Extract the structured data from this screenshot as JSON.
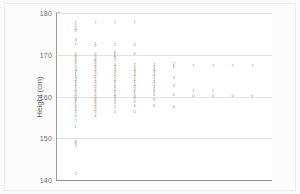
{
  "chart_data": {
    "type": "scatter",
    "title": "",
    "xlabel": "",
    "ylabel": "Height (cm)",
    "ylim": [
      140,
      180
    ],
    "yticks": [
      140,
      150,
      160,
      170,
      180
    ],
    "ytick_labels": [
      "140",
      "150",
      "160",
      "170",
      "180"
    ],
    "xlim": [
      0,
      11
    ],
    "xticks": [],
    "xtick_labels": [],
    "grid": "horizontal",
    "legend": "none",
    "marker_style": "digit-glyph",
    "note": "Each plotted point is drawn as a small digit character stacked vertically at its column position.",
    "colors": {
      "panel_background": "#ffffff",
      "figure_background": "#fcfcfc",
      "gridline": "#e2e2e6",
      "axis": "#8f8f8f",
      "marker": "#8d8d93",
      "tick_label": "#6b6b6b",
      "axis_title": "#5a5a5a"
    },
    "series": [
      {
        "name": "column-1",
        "x": 1,
        "points": [
          {
            "y": 177.6,
            "label": "7"
          },
          {
            "y": 176.8,
            "label": "1"
          },
          {
            "y": 176.2,
            "label": "0"
          },
          {
            "y": 175.6,
            "label": "5"
          },
          {
            "y": 173.6,
            "label": "3"
          },
          {
            "y": 172.6,
            "label": "1"
          },
          {
            "y": 170.2,
            "label": "0"
          },
          {
            "y": 169.4,
            "label": "8"
          },
          {
            "y": 168.8,
            "label": "9"
          },
          {
            "y": 168.2,
            "label": "6"
          },
          {
            "y": 167.6,
            "label": "7"
          },
          {
            "y": 167.0,
            "label": "5"
          },
          {
            "y": 166.4,
            "label": "4"
          },
          {
            "y": 165.8,
            "label": "3"
          },
          {
            "y": 165.2,
            "label": "1"
          },
          {
            "y": 164.6,
            "label": "4"
          },
          {
            "y": 164.0,
            "label": "2"
          },
          {
            "y": 163.4,
            "label": "6"
          },
          {
            "y": 162.8,
            "label": "4"
          },
          {
            "y": 162.2,
            "label": "1"
          },
          {
            "y": 161.6,
            "label": "4"
          },
          {
            "y": 161.0,
            "label": "0"
          },
          {
            "y": 160.4,
            "label": "2"
          },
          {
            "y": 159.8,
            "label": "0"
          },
          {
            "y": 159.2,
            "label": "8"
          },
          {
            "y": 158.6,
            "label": "6"
          },
          {
            "y": 158.0,
            "label": "5"
          },
          {
            "y": 157.4,
            "label": "4"
          },
          {
            "y": 156.8,
            "label": "4"
          },
          {
            "y": 156.2,
            "label": "1"
          },
          {
            "y": 155.4,
            "label": "4"
          },
          {
            "y": 154.2,
            "label": "2"
          },
          {
            "y": 152.6,
            "label": "1"
          },
          {
            "y": 149.2,
            "label": "8"
          },
          {
            "y": 148.6,
            "label": "6"
          },
          {
            "y": 148.0,
            "label": "7"
          },
          {
            "y": 141.4,
            "label": "2"
          }
        ]
      },
      {
        "name": "column-2",
        "x": 2,
        "points": [
          {
            "y": 177.6,
            "label": "7"
          },
          {
            "y": 172.6,
            "label": "1"
          },
          {
            "y": 172.0,
            "label": "0"
          },
          {
            "y": 170.2,
            "label": "0"
          },
          {
            "y": 169.4,
            "label": "9"
          },
          {
            "y": 168.8,
            "label": "8"
          },
          {
            "y": 168.2,
            "label": "6"
          },
          {
            "y": 167.6,
            "label": "5"
          },
          {
            "y": 167.0,
            "label": "4"
          },
          {
            "y": 166.4,
            "label": "4"
          },
          {
            "y": 165.8,
            "label": "3"
          },
          {
            "y": 165.2,
            "label": "2"
          },
          {
            "y": 164.6,
            "label": "4"
          },
          {
            "y": 164.0,
            "label": "1"
          },
          {
            "y": 163.4,
            "label": "4"
          },
          {
            "y": 162.8,
            "label": "2"
          },
          {
            "y": 162.2,
            "label": "0"
          },
          {
            "y": 161.6,
            "label": "4"
          },
          {
            "y": 161.0,
            "label": "1"
          },
          {
            "y": 160.4,
            "label": "0"
          },
          {
            "y": 159.8,
            "label": "0"
          },
          {
            "y": 159.2,
            "label": "8"
          },
          {
            "y": 158.6,
            "label": "6"
          },
          {
            "y": 158.0,
            "label": "5"
          },
          {
            "y": 157.4,
            "label": "4"
          },
          {
            "y": 156.8,
            "label": "2"
          },
          {
            "y": 156.2,
            "label": "0"
          },
          {
            "y": 155.4,
            "label": "4"
          }
        ]
      },
      {
        "name": "column-3",
        "x": 3,
        "points": [
          {
            "y": 177.6,
            "label": "7"
          },
          {
            "y": 172.4,
            "label": "2"
          },
          {
            "y": 170.4,
            "label": "8"
          },
          {
            "y": 169.8,
            "label": "6"
          },
          {
            "y": 169.2,
            "label": "5"
          },
          {
            "y": 168.4,
            "label": "7"
          },
          {
            "y": 167.6,
            "label": "4"
          },
          {
            "y": 167.0,
            "label": "5"
          },
          {
            "y": 166.4,
            "label": "3"
          },
          {
            "y": 165.8,
            "label": "4"
          },
          {
            "y": 165.2,
            "label": "1"
          },
          {
            "y": 164.6,
            "label": "2"
          },
          {
            "y": 164.0,
            "label": "4"
          },
          {
            "y": 163.4,
            "label": "6"
          },
          {
            "y": 162.8,
            "label": "1"
          },
          {
            "y": 162.2,
            "label": "4"
          },
          {
            "y": 161.6,
            "label": "0"
          },
          {
            "y": 161.0,
            "label": "2"
          },
          {
            "y": 160.4,
            "label": "0"
          },
          {
            "y": 159.8,
            "label": "8"
          },
          {
            "y": 159.2,
            "label": "6"
          },
          {
            "y": 158.4,
            "label": "4"
          },
          {
            "y": 157.6,
            "label": "2"
          },
          {
            "y": 156.4,
            "label": "0"
          }
        ]
      },
      {
        "name": "column-4",
        "x": 4,
        "points": [
          {
            "y": 177.6,
            "label": "7"
          },
          {
            "y": 172.4,
            "label": "2"
          },
          {
            "y": 170.2,
            "label": "0"
          },
          {
            "y": 167.6,
            "label": "7"
          },
          {
            "y": 167.0,
            "label": "5"
          },
          {
            "y": 166.4,
            "label": "4"
          },
          {
            "y": 165.8,
            "label": "3"
          },
          {
            "y": 165.2,
            "label": "4"
          },
          {
            "y": 164.6,
            "label": "2"
          },
          {
            "y": 164.0,
            "label": "4"
          },
          {
            "y": 163.4,
            "label": "1"
          },
          {
            "y": 162.8,
            "label": "4"
          },
          {
            "y": 162.2,
            "label": "0"
          },
          {
            "y": 161.6,
            "label": "2"
          },
          {
            "y": 161.0,
            "label": "1"
          },
          {
            "y": 160.4,
            "label": "0"
          },
          {
            "y": 159.6,
            "label": "8"
          },
          {
            "y": 158.8,
            "label": "6"
          },
          {
            "y": 157.8,
            "label": "4"
          },
          {
            "y": 156.4,
            "label": "0"
          }
        ]
      },
      {
        "name": "column-5",
        "x": 5,
        "points": [
          {
            "y": 167.6,
            "label": "7"
          },
          {
            "y": 167.0,
            "label": "5"
          },
          {
            "y": 166.4,
            "label": "4"
          },
          {
            "y": 165.8,
            "label": "3"
          },
          {
            "y": 165.2,
            "label": "4"
          },
          {
            "y": 164.6,
            "label": "2"
          },
          {
            "y": 164.0,
            "label": "1"
          },
          {
            "y": 163.4,
            "label": "4"
          },
          {
            "y": 162.8,
            "label": "2"
          },
          {
            "y": 162.2,
            "label": "1"
          },
          {
            "y": 161.6,
            "label": "0"
          },
          {
            "y": 161.0,
            "label": "0"
          },
          {
            "y": 160.4,
            "label": "0"
          },
          {
            "y": 159.2,
            "label": "8"
          },
          {
            "y": 157.8,
            "label": "6"
          }
        ]
      },
      {
        "name": "column-6",
        "x": 6,
        "points": [
          {
            "y": 167.8,
            "label": "2"
          },
          {
            "y": 167.0,
            "label": "6"
          },
          {
            "y": 164.4,
            "label": "3"
          },
          {
            "y": 162.6,
            "label": "1"
          },
          {
            "y": 160.4,
            "label": "0"
          },
          {
            "y": 157.6,
            "label": "6"
          }
        ]
      },
      {
        "name": "column-7",
        "x": 7,
        "points": [
          {
            "y": 167.4,
            "label": "7"
          },
          {
            "y": 161.2,
            "label": "1"
          },
          {
            "y": 160.2,
            "label": "0"
          }
        ]
      },
      {
        "name": "column-8",
        "x": 8,
        "points": [
          {
            "y": 167.4,
            "label": "7"
          },
          {
            "y": 161.2,
            "label": "1"
          },
          {
            "y": 160.2,
            "label": "0"
          }
        ]
      },
      {
        "name": "column-9",
        "x": 9,
        "points": [
          {
            "y": 167.4,
            "label": "7"
          },
          {
            "y": 160.2,
            "label": "0"
          }
        ]
      },
      {
        "name": "column-10",
        "x": 10,
        "points": [
          {
            "y": 167.4,
            "label": "7"
          },
          {
            "y": 160.2,
            "label": "0"
          }
        ]
      }
    ]
  }
}
